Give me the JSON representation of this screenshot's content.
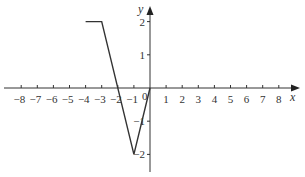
{
  "chart_data": {
    "type": "line",
    "title": "",
    "xlabel": "x",
    "ylabel": "y",
    "xlim": [
      -8.8,
      8.8
    ],
    "ylim": [
      -2.6,
      2.2
    ],
    "grid": false,
    "legend": null,
    "x_ticks": [
      -8,
      -7,
      -6,
      -5,
      -4,
      -3,
      -2,
      -1,
      1,
      2,
      3,
      4,
      5,
      6,
      7,
      8
    ],
    "y_ticks": [
      2,
      1,
      -1,
      -2
    ],
    "origin_label": "0",
    "series": [
      {
        "name": "f(x)",
        "points": [
          [
            -4,
            2
          ],
          [
            -3,
            2
          ],
          [
            -1,
            -2
          ],
          [
            0,
            0
          ]
        ]
      }
    ]
  },
  "labels": {
    "x_axis": "x",
    "y_axis": "y",
    "origin": "0",
    "x_ticks": [
      "−8",
      "−7",
      "−6",
      "−5",
      "−4",
      "−3",
      "−2",
      "−1",
      "1",
      "2",
      "3",
      "4",
      "5",
      "6",
      "7",
      "8"
    ],
    "y_ticks": [
      "2",
      "1",
      "−1",
      "−2"
    ]
  },
  "colors": {
    "axis": "#333333",
    "line": "#333333"
  }
}
